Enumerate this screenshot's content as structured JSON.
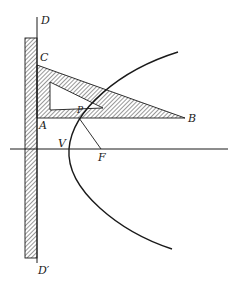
{
  "figure": {
    "colors": {
      "ink": "#1a1a1a",
      "background": "#ffffff"
    }
  },
  "labels": {
    "D": "D",
    "C": "C",
    "A": "A",
    "B": "B",
    "P": "P",
    "V": "V",
    "F": "F",
    "D_prime": "D′"
  }
}
